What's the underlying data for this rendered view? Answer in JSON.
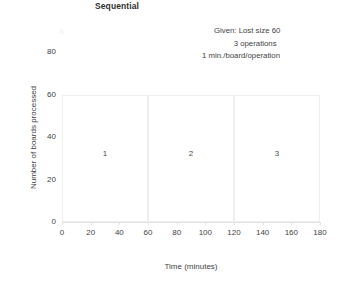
{
  "chart_data": {
    "type": "bar",
    "title": "Sequential",
    "xlabel": "Time (minutes)",
    "ylabel": "Number of boards processed",
    "xlim": [
      0,
      180
    ],
    "ylim": [
      0,
      90
    ],
    "grid": false,
    "legend": "none",
    "x_ticks": [
      0,
      20,
      40,
      60,
      80,
      100,
      120,
      140,
      160,
      180
    ],
    "y_ticks": [
      0,
      20,
      40,
      60,
      80
    ],
    "x_tick_labels": [
      "0",
      "20",
      "40",
      "60",
      "80",
      "100",
      "120",
      "140",
      "160",
      "180"
    ],
    "y_tick_labels": [
      "0",
      "20",
      "40",
      "60",
      "80"
    ],
    "categories": [
      "1",
      "2",
      "3"
    ],
    "values": [
      60,
      60,
      60
    ],
    "bars": [
      {
        "label": "1",
        "x_start": 0,
        "x_end": 60,
        "y_bottom": 0,
        "y_top": 60
      },
      {
        "label": "2",
        "x_start": 60,
        "x_end": 120,
        "y_bottom": 0,
        "y_top": 60
      },
      {
        "label": "3",
        "x_start": 120,
        "x_end": 180,
        "y_bottom": 0,
        "y_top": 60
      }
    ],
    "bar_label_value": 32,
    "annotations": [
      "Given:  Lost size 60",
      "3 operations",
      "1 min./board/operation"
    ]
  },
  "colors": {
    "text": "#3f3f3f",
    "title_text": "#2f2f2f",
    "axis_line": "#e2e2e2",
    "box_outline": "#efefef",
    "background": "#ffffff"
  }
}
